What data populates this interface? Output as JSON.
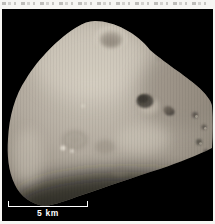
{
  "page": {
    "background": "#f6f5f2"
  },
  "caption_strip": {
    "background": "#f6f5f2",
    "content": "illegible cropped text"
  },
  "photo": {
    "background": "#000000",
    "subject": "irregular cratered moon",
    "moon_colors": {
      "bright": "#d8d1c4",
      "base": "#b2aa9e",
      "mid": "#948c80",
      "limb_dark": "#5e574d"
    },
    "scale_bar": {
      "label": "5 km",
      "color": "#ffffff"
    }
  }
}
